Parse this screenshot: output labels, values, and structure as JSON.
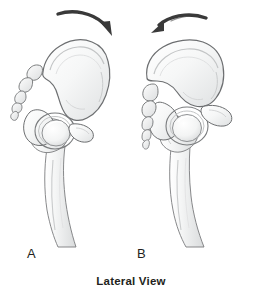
{
  "figure": {
    "caption": "Lateral View",
    "background_color": "#ffffff",
    "width": 262,
    "height": 297
  },
  "panels": [
    {
      "id": "A",
      "label": "A",
      "arrow": {
        "name": "posterior-pelvic-tilt-arrow",
        "direction": "clockwise",
        "points_to": "right-down",
        "color": "#3a3a3a"
      },
      "structures": [
        "ilium",
        "sacrum",
        "coccyx",
        "acetabulum",
        "femoral-head",
        "greater-trochanter",
        "femoral-shaft",
        "ischium",
        "pubis"
      ]
    },
    {
      "id": "B",
      "label": "B",
      "arrow": {
        "name": "anterior-pelvic-tilt-arrow",
        "direction": "counter-clockwise",
        "points_to": "left-down",
        "color": "#3a3a3a"
      },
      "structures": [
        "ilium",
        "sacrum",
        "coccyx",
        "acetabulum",
        "femoral-head",
        "greater-trochanter",
        "femoral-shaft",
        "ischium",
        "pubis"
      ]
    }
  ],
  "colors": {
    "bone_fill_light": "#fbfbfb",
    "bone_fill_mid": "#eceded",
    "bone_fill_shadow": "#d8dadb",
    "bone_outline": "#6d6f71",
    "bone_outline_soft": "#9a9c9e",
    "arrow": "#3a3a3a",
    "text": "#231f20",
    "background": "#ffffff"
  }
}
